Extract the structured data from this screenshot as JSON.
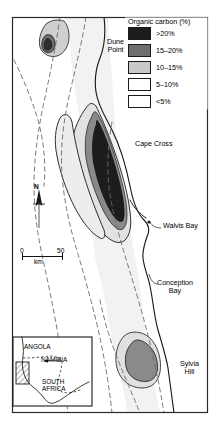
{
  "figure": {
    "type": "map",
    "frame": {
      "x": 12,
      "y": 17,
      "width": 196,
      "height": 396
    }
  },
  "legend": {
    "title": "Organic carbon (%)",
    "entries": [
      {
        "label": ">20%",
        "color": "#1c1c1c",
        "swatch": "black"
      },
      {
        "label": "15–20%",
        "color": "#6e6e6e",
        "swatch": "dark-gray"
      },
      {
        "label": "10–15%",
        "color": "#c9c9c9",
        "swatch": "light-gray"
      },
      {
        "label": "5–10%",
        "color": "#ffffff",
        "swatch": "white"
      },
      {
        "label": "<5%",
        "color": "#ffffff",
        "swatch": "white"
      }
    ]
  },
  "place_labels": [
    {
      "name": "Dune Point",
      "text": "Dune\nPoint",
      "x": 107,
      "y": 40
    },
    {
      "name": "Cape Cross",
      "text": "Cape Cross",
      "x": 138,
      "y": 143
    },
    {
      "name": "Walvis Bay",
      "text": "Walvis Bay",
      "x": 163,
      "y": 225
    },
    {
      "name": "Conception Bay",
      "text": "Conception\nBay",
      "x": 160,
      "y": 281
    },
    {
      "name": "Sylvia Hill",
      "text": "Sylvia\nHill",
      "x": 182,
      "y": 363
    }
  ],
  "scale_bar": {
    "min": "0",
    "max": "50",
    "unit": "km"
  },
  "north_arrow": {
    "label": "N"
  },
  "inset": {
    "countries": [
      {
        "name": "Angola",
        "text": "ANGOLA",
        "x": 9,
        "y": 7
      },
      {
        "name": "Namibia",
        "text": "NAMIBIA",
        "x": 26,
        "y": 20
      },
      {
        "name": "South Africa",
        "text": "SOUTH\nAFRICA",
        "x": 27,
        "y": 43
      }
    ],
    "study_area_marker": "hatched-box"
  },
  "colors": {
    "carbon_gt20": "#1c1c1c",
    "carbon_15_20": "#6e6e6e",
    "carbon_10_15": "#c9c9c9",
    "carbon_5_10": "#ececec",
    "carbon_lt5": "#ffffff",
    "coastline": "#1a1a1a",
    "contour": "#555555",
    "frame": "#2a2a2a",
    "shelf_fill": "#f0f0f0"
  }
}
